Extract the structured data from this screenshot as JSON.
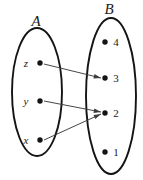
{
  "diagram": {
    "type": "set-mapping-diagram",
    "sets": [
      {
        "id": "A",
        "label": "A",
        "label_x": 36,
        "label_y": 26,
        "ellipse": {
          "cx": 37,
          "cy": 92,
          "rx": 25,
          "ry": 64
        },
        "elements": [
          {
            "id": "z",
            "label": "z",
            "label_style": "italic",
            "dot_x": 40,
            "dot_y": 63,
            "label_x": 26,
            "label_y": 67
          },
          {
            "id": "y",
            "label": "y",
            "label_style": "italic",
            "dot_x": 40,
            "dot_y": 101,
            "label_x": 26,
            "label_y": 105
          },
          {
            "id": "x",
            "label": "x",
            "label_style": "italic",
            "dot_x": 40,
            "dot_y": 140,
            "label_x": 26,
            "label_y": 144
          }
        ]
      },
      {
        "id": "B",
        "label": "B",
        "label_x": 109,
        "label_y": 14,
        "ellipse": {
          "cx": 111,
          "cy": 96,
          "rx": 25,
          "ry": 78
        },
        "elements": [
          {
            "id": "4",
            "label": "4",
            "label_style": "normal",
            "dot_x": 105,
            "dot_y": 42,
            "label_x": 116,
            "label_y": 46
          },
          {
            "id": "3",
            "label": "3",
            "label_style": "normal",
            "dot_x": 105,
            "dot_y": 78,
            "label_x": 116,
            "label_y": 82
          },
          {
            "id": "2",
            "label": "2",
            "label_style": "normal",
            "dot_x": 105,
            "dot_y": 113,
            "label_x": 116,
            "label_y": 117
          },
          {
            "id": "1",
            "label": "1",
            "label_style": "normal",
            "dot_x": 105,
            "dot_y": 152,
            "label_x": 116,
            "label_y": 156
          }
        ]
      }
    ],
    "mappings": [
      {
        "id": "z-to-3",
        "from": "z",
        "to": "3",
        "from_x": 44,
        "from_y": 64,
        "to_x": 101,
        "to_y": 78
      },
      {
        "id": "y-to-2",
        "from": "y",
        "to": "2",
        "from_x": 44,
        "from_y": 101,
        "to_x": 101,
        "to_y": 112
      },
      {
        "id": "x-to-2",
        "from": "x",
        "to": "2",
        "from_x": 44,
        "from_y": 140,
        "to_x": 101,
        "to_y": 114
      }
    ],
    "colors": {
      "background": "#ffffff",
      "outline": "#141414",
      "dot": "#141414",
      "arrow": "#3c3c3c",
      "text": "#1a1a1a"
    }
  }
}
